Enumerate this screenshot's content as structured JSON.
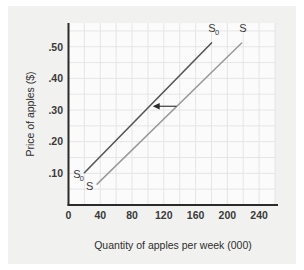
{
  "chart_data": {
    "type": "line",
    "title": "",
    "xlabel": "Quantity of apples per week (000)",
    "ylabel": "Price of apples ($)",
    "xlim": [
      0,
      260
    ],
    "ylim": [
      0,
      0.575
    ],
    "xticks": [
      "0",
      "40",
      "80",
      "120",
      "160",
      "200",
      "240"
    ],
    "xtick_values": [
      0,
      40,
      80,
      120,
      160,
      200,
      240
    ],
    "yticks": [
      ".10",
      ".20",
      ".30",
      ".40",
      ".50"
    ],
    "ytick_values": [
      0.1,
      0.2,
      0.3,
      0.4,
      0.5
    ],
    "grid": true,
    "grid_x_step": 20,
    "grid_y_step": 0.05,
    "legend": "inline-endpoint-labels",
    "series": [
      {
        "name": "S0",
        "label": "S",
        "label_sub": "0",
        "color": "#565656",
        "width": 1.6,
        "points": [
          [
            20,
            0.102
          ],
          [
            180,
            0.512
          ]
        ]
      },
      {
        "name": "S",
        "label": "S",
        "label_sub": "",
        "color": "#9a9a9a",
        "width": 1.5,
        "points": [
          [
            36,
            0.066
          ],
          [
            218,
            0.512
          ]
        ]
      }
    ],
    "annotations": [
      {
        "name": "shift-arrow",
        "type": "arrow",
        "direction": "left",
        "from": [
          136,
          0.312
        ],
        "to": [
          106,
          0.312
        ],
        "color": "#2b2b2b"
      }
    ],
    "endpoint_labels": [
      {
        "name": "s0-top-label",
        "text": "S",
        "sub": "0",
        "x": 176,
        "y": 0.545
      },
      {
        "name": "s-top-label",
        "text": "S",
        "sub": "",
        "x": 215,
        "y": 0.545
      },
      {
        "name": "s0-bottom-label",
        "text": "S",
        "sub": "0",
        "x": 6,
        "y": 0.085
      },
      {
        "name": "s-bottom-label",
        "text": "S",
        "sub": "",
        "x": 22,
        "y": 0.046
      }
    ]
  },
  "colors": {
    "canvas": "#f1f1f0",
    "plot_bg": "#fbfbfb",
    "grid": "#e3e3e6",
    "axis": "#2b2b2b",
    "text": "#2e2e2e",
    "s0_line": "#565656",
    "s_line": "#9a9a9a"
  }
}
